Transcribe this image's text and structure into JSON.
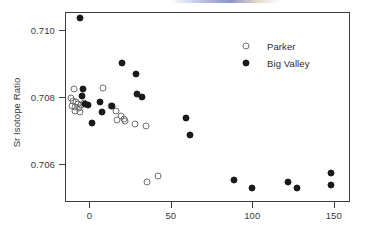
{
  "chart_data": {
    "type": "scatter",
    "title": "",
    "xlabel": "",
    "ylabel": "Sr Isotope Ratio",
    "xlim": [
      -15,
      160
    ],
    "ylim": [
      0.70485,
      0.71055
    ],
    "xticks": [
      0,
      50,
      100,
      150
    ],
    "xtick_labels": [
      "0",
      "50",
      "100",
      "150"
    ],
    "yticks": [
      0.706,
      0.708,
      0.71
    ],
    "ytick_labels": [
      "0.706",
      "0.708",
      "0.710"
    ],
    "grid": false,
    "legend_position": "top-right",
    "series": [
      {
        "name": "Parker",
        "marker": "open-circle",
        "color": "#6f6f6f",
        "points": [
          {
            "x": -9.5,
            "y": 0.70824
          },
          {
            "x": -11.5,
            "y": 0.70796
          },
          {
            "x": -9.8,
            "y": 0.70789
          },
          {
            "x": -8.2,
            "y": 0.70785
          },
          {
            "x": -7.0,
            "y": 0.70779
          },
          {
            "x": -10.5,
            "y": 0.70772
          },
          {
            "x": -8.6,
            "y": 0.70769
          },
          {
            "x": -6.5,
            "y": 0.70766
          },
          {
            "x": -5.0,
            "y": 0.70776
          },
          {
            "x": -3.2,
            "y": 0.70781
          },
          {
            "x": -9.0,
            "y": 0.70758
          },
          {
            "x": -6.0,
            "y": 0.70755
          },
          {
            "x": 8.5,
            "y": 0.70826
          },
          {
            "x": 13.5,
            "y": 0.70772
          },
          {
            "x": 16.5,
            "y": 0.70757
          },
          {
            "x": 19.5,
            "y": 0.70742
          },
          {
            "x": 21.5,
            "y": 0.70735
          },
          {
            "x": 17.0,
            "y": 0.70731
          },
          {
            "x": 22.0,
            "y": 0.70728
          },
          {
            "x": 28.0,
            "y": 0.70718
          },
          {
            "x": 35.0,
            "y": 0.70713
          },
          {
            "x": 35.5,
            "y": 0.70545
          },
          {
            "x": 42.0,
            "y": 0.70563
          }
        ]
      },
      {
        "name": "Big Valley",
        "marker": "filled-circle",
        "color": "#1a1a1a",
        "points": [
          {
            "x": -5.5,
            "y": 0.71037
          },
          {
            "x": -4.0,
            "y": 0.70825
          },
          {
            "x": -4.5,
            "y": 0.70803
          },
          {
            "x": -2.5,
            "y": 0.70779
          },
          {
            "x": -1.0,
            "y": 0.70776
          },
          {
            "x": 1.5,
            "y": 0.70722
          },
          {
            "x": 6.5,
            "y": 0.70785
          },
          {
            "x": 7.5,
            "y": 0.70756
          },
          {
            "x": 14.0,
            "y": 0.70772
          },
          {
            "x": 20.0,
            "y": 0.70901
          },
          {
            "x": 28.5,
            "y": 0.70869
          },
          {
            "x": 29.0,
            "y": 0.70809
          },
          {
            "x": 32.5,
            "y": 0.70801
          },
          {
            "x": 59.0,
            "y": 0.70736
          },
          {
            "x": 62.0,
            "y": 0.70686
          },
          {
            "x": 89.0,
            "y": 0.70551
          },
          {
            "x": 100.0,
            "y": 0.70527
          },
          {
            "x": 119.5,
            "y": 0.70448
          },
          {
            "x": 122.0,
            "y": 0.70546
          },
          {
            "x": 127.5,
            "y": 0.70526
          },
          {
            "x": 148.5,
            "y": 0.70571
          },
          {
            "x": 148.5,
            "y": 0.70535
          },
          {
            "x": 148.5,
            "y": 0.70466
          }
        ]
      }
    ]
  },
  "legend": {
    "items": [
      {
        "label": "Parker",
        "marker": "open-circle"
      },
      {
        "label": "Big Valley",
        "marker": "filled-circle"
      }
    ]
  },
  "axes": {
    "y_axis_title": "Sr Isotope Ratio",
    "x_axis_title": ""
  }
}
